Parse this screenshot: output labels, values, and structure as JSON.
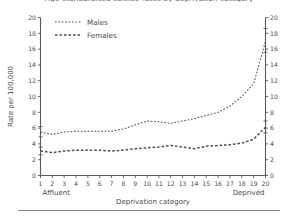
{
  "figure": {
    "clipped_title": "Age-standardised suicide rates by deprivation category",
    "footer_rule_visible": true
  },
  "legend": {
    "position": "top-left-inside",
    "entries": [
      {
        "label": "Males",
        "style": "fine-dotted"
      },
      {
        "label": "Females",
        "style": "dashed"
      }
    ]
  },
  "axes": {
    "y_label": "Rate per 100,000",
    "y_ticks": [
      "0",
      "2",
      "4",
      "6",
      "8",
      "10",
      "12",
      "14",
      "16",
      "18",
      "20"
    ],
    "y_ticks_right": [
      "0",
      "2",
      "4",
      "6",
      "8",
      "10",
      "12",
      "14",
      "16",
      "18",
      "20"
    ],
    "x_label": "Deprivation category",
    "x_ticks": [
      "1",
      "2",
      "3",
      "4",
      "5",
      "6",
      "7",
      "8",
      "9",
      "10",
      "11",
      "12",
      "13",
      "14",
      "15",
      "16",
      "17",
      "18",
      "19",
      "20"
    ],
    "x_left_end_label": "Affluent",
    "x_right_end_label": "Deprived"
  },
  "chart_data": {
    "type": "line",
    "title": "Age-standardised suicide rates by deprivation category",
    "xlabel": "Deprivation category",
    "ylabel": "Rate per 100,000",
    "xlim": [
      1,
      20
    ],
    "ylim": [
      0,
      20
    ],
    "grid": false,
    "legend_position": "top-left",
    "x": [
      1,
      2,
      3,
      4,
      5,
      6,
      7,
      8,
      9,
      10,
      11,
      12,
      13,
      14,
      15,
      16,
      17,
      18,
      19,
      20
    ],
    "series": [
      {
        "name": "Males",
        "line_style": "fine-dotted",
        "color": "#4f4f4f",
        "values": [
          5.5,
          5.2,
          5.5,
          5.6,
          5.6,
          5.6,
          5.6,
          5.9,
          6.4,
          6.9,
          6.8,
          6.6,
          6.9,
          7.2,
          7.6,
          8.0,
          8.8,
          10.0,
          11.6,
          17.0
        ],
        "error_bars": [
          {
            "x": 1,
            "value": 5.5,
            "lower": 4.9,
            "upper": 6.2
          },
          {
            "x": 20,
            "value": 17.0,
            "lower": 15.6,
            "upper": 18.6
          }
        ]
      },
      {
        "name": "Females",
        "line_style": "dashed",
        "color": "#4f4f4f",
        "values": [
          3.1,
          2.9,
          3.1,
          3.2,
          3.2,
          3.2,
          3.1,
          3.2,
          3.4,
          3.5,
          3.6,
          3.8,
          3.6,
          3.4,
          3.7,
          3.8,
          3.9,
          4.1,
          4.6,
          6.1
        ],
        "error_bars": [
          {
            "x": 1,
            "value": 3.1,
            "lower": 2.6,
            "upper": 3.6
          },
          {
            "x": 20,
            "value": 6.1,
            "lower": 5.4,
            "upper": 6.9
          }
        ]
      }
    ]
  }
}
